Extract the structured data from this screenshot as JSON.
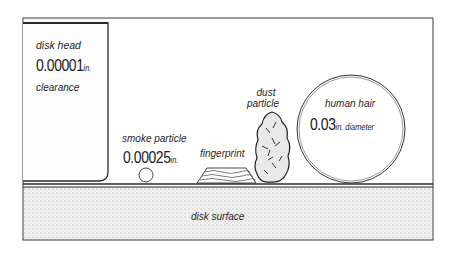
{
  "diagram": {
    "disk_head": {
      "label": "disk head",
      "value": "0.00001",
      "unit": "in.",
      "caption": "clearance"
    },
    "smoke_particle": {
      "label": "smoke particle",
      "value": "0.00025",
      "unit": "in."
    },
    "fingerprint": {
      "label": "fingerprint"
    },
    "dust_particle": {
      "label_line1": "dust",
      "label_line2": "particle"
    },
    "human_hair": {
      "label": "human hair",
      "value": "0.03",
      "unit": "in. diameter"
    },
    "disk_surface": {
      "label": "disk surface"
    },
    "colors": {
      "ink": "#2a2a2a",
      "surface_stipple": "#c8c8c8",
      "background": "#ffffff"
    }
  }
}
